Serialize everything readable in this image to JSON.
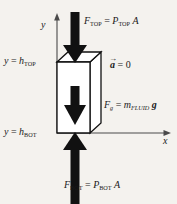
{
  "figure": {
    "name": "fluid-element-free-body-diagram",
    "background_color": "#f4f2ee",
    "ink_color": "#111111",
    "axis_color": "#4a4a4a"
  },
  "axes": {
    "y_label": "y",
    "x_label": "x",
    "origin_px": [
      57,
      133
    ],
    "y_axis_top_px": [
      57,
      15
    ],
    "x_axis_right_px": [
      170,
      133
    ]
  },
  "levels": [
    {
      "id": "top-level",
      "prefix": "y",
      "equals": "=",
      "symbol": "h",
      "subscript": "TOP",
      "y_px": 62
    },
    {
      "id": "bot-level",
      "prefix": "y",
      "equals": "=",
      "symbol": "h",
      "subscript": "BOT",
      "y_px": 133
    }
  ],
  "box": {
    "name": "fluid-element-box",
    "front_face": [
      [
        57,
        62
      ],
      [
        90,
        62
      ],
      [
        90,
        133
      ],
      [
        57,
        133
      ]
    ],
    "top_face": [
      [
        57,
        62
      ],
      [
        68,
        52
      ],
      [
        101,
        52
      ],
      [
        90,
        62
      ]
    ],
    "right_face": [
      [
        90,
        62
      ],
      [
        101,
        52
      ],
      [
        101,
        123
      ],
      [
        90,
        133
      ]
    ],
    "fill": "#ffffff",
    "stroke": "#111111"
  },
  "forces": [
    {
      "id": "f-top",
      "direction": "down",
      "label": {
        "f": "F",
        "f_sub": "TOP",
        "equals": "=",
        "p": "P",
        "p_sub": "TOP",
        "area": "A"
      }
    },
    {
      "id": "f-gravity",
      "direction": "down",
      "label": {
        "f": "F",
        "f_sub": "g",
        "equals": "=",
        "m": "m",
        "m_sub": "FLUID",
        "g": "g"
      }
    },
    {
      "id": "f-bot",
      "direction": "up",
      "label": {
        "f": "F",
        "f_sub": "BOT",
        "equals": "=",
        "p": "P",
        "p_sub": "BOT",
        "area": "A"
      }
    }
  ],
  "acceleration": {
    "id": "acceleration-annotation",
    "symbol": "a",
    "accent": "→",
    "equals": "=",
    "value": "0"
  }
}
